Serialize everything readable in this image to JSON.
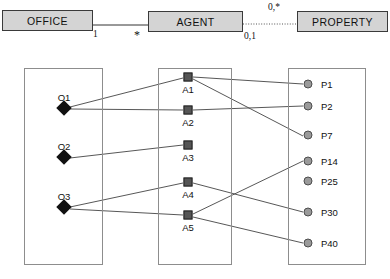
{
  "diagram": {
    "title_entities": [
      {
        "id": "office",
        "label": "OFFICE"
      },
      {
        "id": "agent",
        "label": "AGENT"
      },
      {
        "id": "property",
        "label": "PROPERTY"
      }
    ],
    "multiplicities": [
      {
        "id": "office-agent",
        "label": "1"
      },
      {
        "id": "agent-office",
        "label": "*"
      },
      {
        "id": "agent-property",
        "label": "0,1"
      },
      {
        "id": "property-agent",
        "label": "0,*"
      }
    ],
    "relationship_lines": [
      {
        "id": "office-agent-line",
        "style": "solid"
      },
      {
        "id": "agent-property-line",
        "style": "dotted"
      }
    ],
    "panels": [
      {
        "id": "office-instances",
        "entity": "OFFICE"
      },
      {
        "id": "agent-instances",
        "entity": "AGENT"
      },
      {
        "id": "property-instances",
        "entity": "PROPERTY"
      }
    ],
    "office_instances": [
      {
        "id": "O1",
        "label": "O1",
        "x": 64,
        "y": 108,
        "shape": "diamond"
      },
      {
        "id": "O2",
        "label": "O2",
        "x": 64,
        "y": 157,
        "shape": "diamond"
      },
      {
        "id": "O3",
        "label": "O3",
        "x": 64,
        "y": 207,
        "shape": "diamond"
      }
    ],
    "agent_instances": [
      {
        "id": "A1",
        "label": "A1",
        "x": 188,
        "y": 77,
        "shape": "square"
      },
      {
        "id": "A2",
        "label": "A2",
        "x": 188,
        "y": 110,
        "shape": "square"
      },
      {
        "id": "A3",
        "label": "A3",
        "x": 188,
        "y": 145,
        "shape": "square"
      },
      {
        "id": "A4",
        "label": "A4",
        "x": 188,
        "y": 182,
        "shape": "square"
      },
      {
        "id": "A5",
        "label": "A5",
        "x": 188,
        "y": 215,
        "shape": "square"
      }
    ],
    "property_instances": [
      {
        "id": "P1",
        "label": "P1",
        "x": 308,
        "y": 84,
        "shape": "circle"
      },
      {
        "id": "P2",
        "label": "P2",
        "x": 308,
        "y": 106,
        "shape": "circle"
      },
      {
        "id": "P7",
        "label": "P7",
        "x": 308,
        "y": 135,
        "shape": "circle"
      },
      {
        "id": "P14",
        "label": "P14",
        "x": 308,
        "y": 161,
        "shape": "circle"
      },
      {
        "id": "P25",
        "label": "P25",
        "x": 308,
        "y": 181,
        "shape": "circle"
      },
      {
        "id": "P30",
        "label": "P30",
        "x": 308,
        "y": 212,
        "shape": "circle"
      },
      {
        "id": "P40",
        "label": "P40",
        "x": 308,
        "y": 243,
        "shape": "circle"
      }
    ],
    "links": [
      {
        "from": "O1",
        "to": "A1"
      },
      {
        "from": "O1",
        "to": "A2"
      },
      {
        "from": "O2",
        "to": "A3"
      },
      {
        "from": "O3",
        "to": "A4"
      },
      {
        "from": "O3",
        "to": "A5"
      },
      {
        "from": "A1",
        "to": "P1"
      },
      {
        "from": "A1",
        "to": "P7"
      },
      {
        "from": "A2",
        "to": "P2"
      },
      {
        "from": "A4",
        "to": "P30"
      },
      {
        "from": "A5",
        "to": "P14"
      },
      {
        "from": "A5",
        "to": "P40"
      }
    ],
    "colors": {
      "entity_fill": "#d4d4d4",
      "entity_border": "#3a3a3a",
      "panel_border": "#8d8d8d",
      "office_node": "#111111",
      "agent_node": "#555555",
      "property_node": "#9a9a9a",
      "edge": "#444444"
    }
  }
}
